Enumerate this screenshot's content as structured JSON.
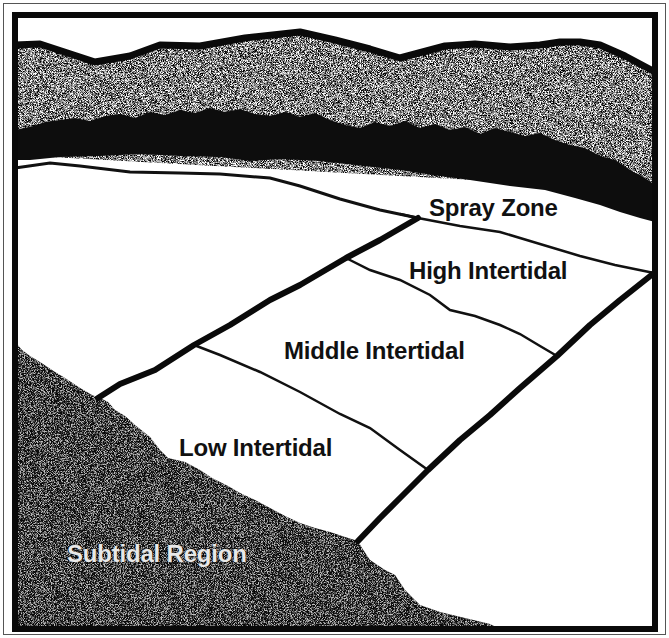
{
  "diagram": {
    "zones": [
      {
        "id": "spray",
        "label": "Spray Zone"
      },
      {
        "id": "high",
        "label": "High Intertidal"
      },
      {
        "id": "middle",
        "label": "Middle Intertidal"
      },
      {
        "id": "low",
        "label": "Low Intertidal"
      },
      {
        "id": "subtidal",
        "label": "Subtidal Region"
      }
    ],
    "colors": {
      "ink": "#111111",
      "background": "#ffffff",
      "stipple_light": "#9a9a9a",
      "subtidal_label": "#e8e8e8"
    }
  }
}
